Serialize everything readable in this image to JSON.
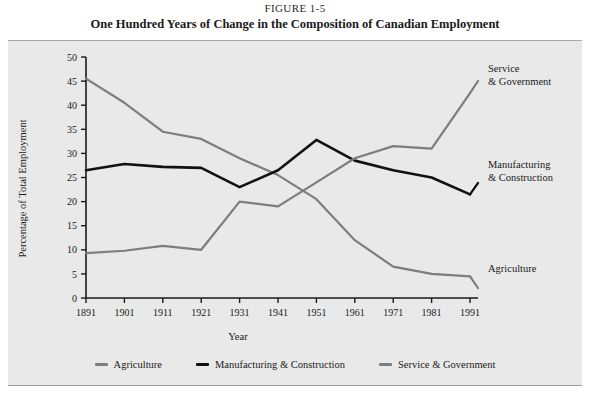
{
  "figure": {
    "number": "FIGURE 1-5",
    "title": "One Hundred Years of Change in the Composition of Canadian Employment"
  },
  "annotations": {
    "service_line1": "Service",
    "service_line2": "& Government",
    "manufacturing_line1": "Manufacturing",
    "manufacturing_line2": "& Construction",
    "agriculture": "Agriculture"
  },
  "legend": {
    "position": "bottom",
    "items": [
      {
        "label": "Agriculture",
        "color": "#7d7d7d"
      },
      {
        "label": "Manufacturing & Construction",
        "color": "#111111"
      },
      {
        "label": "Service & Government",
        "color": "#7d7d7d"
      }
    ]
  },
  "chart_data": {
    "type": "line",
    "title": "One Hundred Years of Change in the Composition of Canadian Employment",
    "xlabel": "Year",
    "ylabel": "Percentage of Total Employment",
    "categories": [
      "1891",
      "1901",
      "1911",
      "1921",
      "1931",
      "1941",
      "1951",
      "1961",
      "1971",
      "1981",
      "1991"
    ],
    "xticklabels": [
      "1891",
      "1901",
      "1911",
      "1921",
      "1931",
      "1941",
      "1951",
      "1961",
      "1971",
      "1981",
      "1991"
    ],
    "yticklabels": [
      "0",
      "5",
      "10",
      "15",
      "20",
      "25",
      "30",
      "35",
      "40",
      "45",
      "50"
    ],
    "ylim": [
      0,
      50
    ],
    "ytick_step": 5,
    "grid": false,
    "series": [
      {
        "name": "Agriculture",
        "color": "#7d7d7d",
        "values": [
          45.5,
          40.5,
          34.5,
          33.0,
          29.0,
          25.5,
          20.5,
          12.0,
          6.5,
          5.0,
          4.5
        ]
      },
      {
        "name": "Manufacturing & Construction",
        "color": "#111111",
        "values": [
          26.5,
          27.8,
          27.2,
          27.0,
          23.0,
          26.5,
          32.8,
          28.5,
          26.5,
          25.0,
          21.5
        ]
      },
      {
        "name": "Service & Government",
        "color": "#7d7d7d",
        "values": [
          9.3,
          9.8,
          10.8,
          10.0,
          20.0,
          19.0,
          24.0,
          29.0,
          31.5,
          31.0,
          42.5
        ]
      }
    ]
  }
}
